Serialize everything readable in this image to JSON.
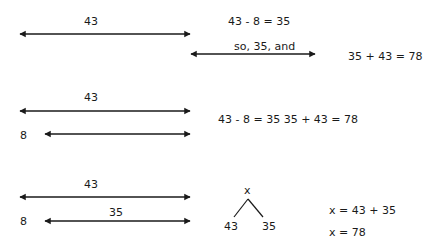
{
  "section1": {
    "bar_label": "43",
    "second_bar_label": "so, 35, and",
    "equation_top": "43 - 8 = 35",
    "equation_right": "35 + 43 = 78"
  },
  "section2": {
    "top_bar_label": "43",
    "left_label": "8",
    "equations": "43 - 8 = 35   35 + 43 = 78"
  },
  "section3": {
    "top_bar_label": "43",
    "bottom_bar_label": "35",
    "left_label": "8",
    "tree": {
      "root": "x",
      "left": "43",
      "right": "35"
    },
    "equation_1": "x = 43 + 35",
    "equation_2": "x = 78"
  },
  "colors": {
    "ink": "#1a1a1a",
    "background": "#ffffff"
  }
}
